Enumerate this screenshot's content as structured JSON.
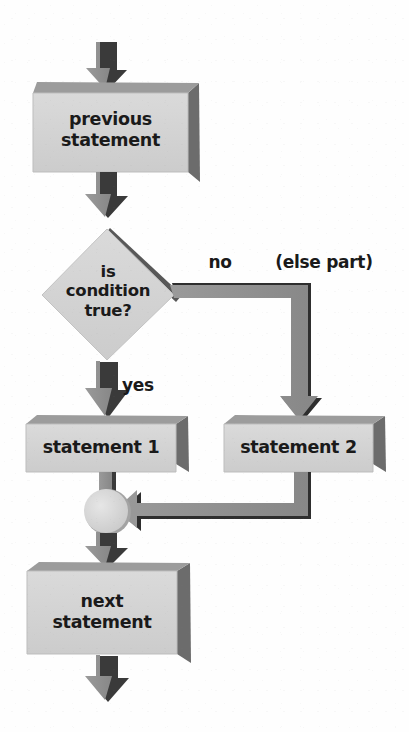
{
  "diagram": {
    "palette": {
      "face": "#d3d3d3",
      "top_bevel": "#9c9c9c",
      "side_bevel": "#6f6f6f",
      "arrow_body": "#8f8f8f",
      "arrow_shadow": "#333333",
      "circle_fill": "#dcdcdc",
      "circle_shade": "#a8a8a8",
      "text": "#1a1a1a",
      "background": "#ffffff"
    },
    "nodes": [
      {
        "id": "previous",
        "type": "process",
        "lines": [
          "previous",
          "statement"
        ]
      },
      {
        "id": "condition",
        "type": "decision",
        "lines": [
          "is",
          "condition",
          "true?"
        ]
      },
      {
        "id": "statement1",
        "type": "process",
        "lines": [
          "statement 1"
        ]
      },
      {
        "id": "statement2",
        "type": "process",
        "lines": [
          "statement 2"
        ]
      },
      {
        "id": "merge",
        "type": "connector",
        "lines": []
      },
      {
        "id": "next",
        "type": "process",
        "lines": [
          "next",
          "statement"
        ]
      }
    ],
    "edge_labels": {
      "yes": "yes",
      "no": "no",
      "else_part": "(else part)"
    },
    "edges": [
      {
        "from": "entry",
        "to": "previous",
        "label": ""
      },
      {
        "from": "previous",
        "to": "condition",
        "label": ""
      },
      {
        "from": "condition",
        "to": "statement1",
        "label": "yes"
      },
      {
        "from": "condition",
        "to": "statement2",
        "label": "no"
      },
      {
        "from": "statement1",
        "to": "merge",
        "label": ""
      },
      {
        "from": "statement2",
        "to": "merge",
        "label": ""
      },
      {
        "from": "merge",
        "to": "next",
        "label": ""
      },
      {
        "from": "next",
        "to": "exit",
        "label": ""
      }
    ]
  }
}
